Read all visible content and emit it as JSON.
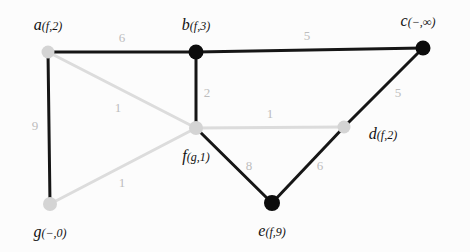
{
  "figure": {
    "kind": "weighted-undirected-graph",
    "width": 470,
    "height": 252,
    "background": "#fcfcfc",
    "colors": {
      "edge_dark": "#161616",
      "edge_light": "#dcdcdc",
      "node_dark": "#0c0c0c",
      "node_light": "#d4d4d4",
      "label_dark": "#111111",
      "label_light": "#bdbdbd"
    }
  },
  "nodes": [
    {
      "id": "a",
      "name": "a",
      "annotation": "(f,2)",
      "x": 48,
      "y": 52,
      "fill": "light",
      "label_x": 48,
      "label_y": 25,
      "radius": 6.5
    },
    {
      "id": "b",
      "name": "b",
      "annotation": "(f,3)",
      "x": 196,
      "y": 52,
      "fill": "dark",
      "label_x": 196,
      "label_y": 25,
      "radius": 7.5
    },
    {
      "id": "c",
      "name": "c",
      "annotation": "(−,∞)",
      "x": 423,
      "y": 48,
      "fill": "dark",
      "label_x": 418,
      "label_y": 21,
      "radius": 7.5
    },
    {
      "id": "d",
      "name": "d",
      "annotation": "(f,2)",
      "x": 344,
      "y": 127,
      "fill": "light",
      "label_x": 383,
      "label_y": 134,
      "radius": 6.5
    },
    {
      "id": "e",
      "name": "e",
      "annotation": "(f,9)",
      "x": 272,
      "y": 203,
      "fill": "dark",
      "label_x": 272,
      "label_y": 231,
      "radius": 8.0
    },
    {
      "id": "f",
      "name": "f",
      "annotation": "(g,1)",
      "x": 196,
      "y": 128,
      "fill": "light",
      "label_x": 196,
      "label_y": 156,
      "radius": 7.0
    },
    {
      "id": "g",
      "name": "g",
      "annotation": "(−,0)",
      "x": 50,
      "y": 204,
      "fill": "light",
      "label_x": 50,
      "label_y": 232,
      "radius": 7.0
    }
  ],
  "edges": [
    {
      "from": "a",
      "to": "b",
      "weight": "6",
      "tone": "dark",
      "width": 3.0,
      "label_x": 122,
      "label_y": 37,
      "label_tone": "light"
    },
    {
      "from": "a",
      "to": "g",
      "weight": "9",
      "tone": "dark",
      "width": 3.0,
      "label_x": 35,
      "label_y": 125,
      "label_tone": "light"
    },
    {
      "from": "a",
      "to": "f",
      "weight": "1",
      "tone": "light",
      "width": 3.0,
      "label_x": 118,
      "label_y": 107,
      "label_tone": "light"
    },
    {
      "from": "b",
      "to": "c",
      "weight": "5",
      "tone": "dark",
      "width": 3.0,
      "label_x": 307,
      "label_y": 35,
      "label_tone": "light"
    },
    {
      "from": "b",
      "to": "f",
      "weight": "2",
      "tone": "dark",
      "width": 3.0,
      "label_x": 207,
      "label_y": 92,
      "label_tone": "light"
    },
    {
      "from": "c",
      "to": "d",
      "weight": "5",
      "tone": "dark",
      "width": 3.0,
      "label_x": 398,
      "label_y": 92,
      "label_tone": "light"
    },
    {
      "from": "f",
      "to": "d",
      "weight": "1",
      "tone": "light",
      "width": 3.0,
      "label_x": 270,
      "label_y": 113,
      "label_tone": "light"
    },
    {
      "from": "f",
      "to": "e",
      "weight": "8",
      "tone": "dark",
      "width": 3.0,
      "label_x": 249,
      "label_y": 165,
      "label_tone": "light"
    },
    {
      "from": "d",
      "to": "e",
      "weight": "6",
      "tone": "dark",
      "width": 3.0,
      "label_x": 320,
      "label_y": 165,
      "label_tone": "light"
    },
    {
      "from": "g",
      "to": "f",
      "weight": "1",
      "tone": "light",
      "width": 3.0,
      "label_x": 122,
      "label_y": 182,
      "label_tone": "light"
    }
  ]
}
